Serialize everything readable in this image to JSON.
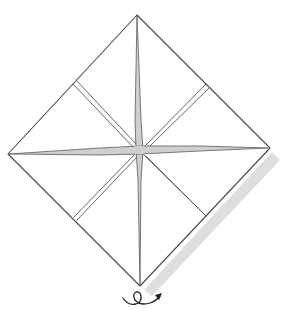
{
  "diagram": {
    "type": "origami-step",
    "colors": {
      "background": "#ffffff",
      "edge": "#4a4a4a",
      "crease_fill": "#cfcfcf",
      "shadow": "#dedede",
      "symbol": "#222222"
    },
    "vertices": {
      "top": [
        137,
        15
      ],
      "left": [
        8,
        154
      ],
      "right": [
        270,
        148
      ],
      "bottom": [
        140,
        286
      ],
      "center": [
        140,
        150
      ]
    },
    "inner_fold_corners": {
      "upper_left": [
        76,
        82
      ],
      "upper_right": [
        206,
        86
      ],
      "lower_left": [
        76,
        219
      ],
      "lower_right": [
        205,
        214
      ]
    },
    "symbols": [
      {
        "name": "turn-over-symbol",
        "meaning": "Turn the model over",
        "position": [
          141,
          298
        ]
      }
    ]
  }
}
